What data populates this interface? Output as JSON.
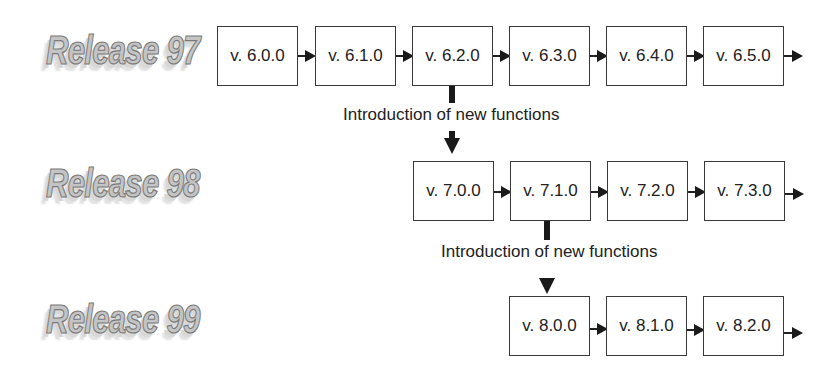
{
  "diagram": {
    "type": "release-version-timeline",
    "releases": [
      {
        "label": "Release 97",
        "versions": [
          "v. 6.0.0",
          "v. 6.1.0",
          "v. 6.2.0",
          "v. 6.3.0",
          "v. 6.4.0",
          "v. 6.5.0"
        ]
      },
      {
        "label": "Release 98",
        "versions": [
          "v. 7.0.0",
          "v. 7.1.0",
          "v. 7.2.0",
          "v. 7.3.0"
        ]
      },
      {
        "label": "Release 99",
        "versions": [
          "v. 8.0.0",
          "v. 8.1.0",
          "v. 8.2.0"
        ]
      }
    ],
    "transitions": [
      {
        "from": "v. 6.2.0",
        "to": "v. 7.0.0",
        "label": "Introduction of new functions"
      },
      {
        "from": "v. 7.1.0",
        "to": "v. 8.0.0",
        "label": "Introduction of new functions"
      }
    ],
    "colors": {
      "box_border": "#3a3a3a",
      "arrow": "#1a1a1a",
      "text": "#222222",
      "release_fill": "#c4c4c4",
      "release_outline": "#7a7a7a"
    }
  }
}
